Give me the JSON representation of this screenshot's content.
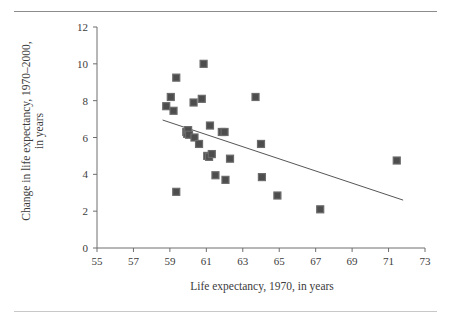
{
  "chart_data": {
    "type": "scatter",
    "title": "",
    "xlabel": "Life expectancy, 1970, in years",
    "ylabel": "Change in life expectancy, 1970–2000,\nin years",
    "xlim": [
      55,
      73
    ],
    "ylim": [
      0,
      12
    ],
    "xticks": [
      55,
      57,
      59,
      61,
      63,
      65,
      67,
      69,
      71,
      73
    ],
    "yticks": [
      0,
      2,
      4,
      6,
      8,
      10,
      12
    ],
    "grid": false,
    "legend": null,
    "marker": {
      "shape": "square",
      "color": "#4d4d4d",
      "size": 7
    },
    "points": [
      {
        "x": 58.8,
        "y": 7.7
      },
      {
        "x": 59.05,
        "y": 8.2
      },
      {
        "x": 59.2,
        "y": 7.45
      },
      {
        "x": 59.35,
        "y": 9.25
      },
      {
        "x": 59.35,
        "y": 3.05
      },
      {
        "x": 59.9,
        "y": 6.3
      },
      {
        "x": 59.95,
        "y": 6.2
      },
      {
        "x": 60.0,
        "y": 6.4
      },
      {
        "x": 60.05,
        "y": 6.15
      },
      {
        "x": 60.3,
        "y": 7.9
      },
      {
        "x": 60.35,
        "y": 6.0
      },
      {
        "x": 60.6,
        "y": 5.65
      },
      {
        "x": 60.75,
        "y": 8.1
      },
      {
        "x": 60.85,
        "y": 10.0
      },
      {
        "x": 61.05,
        "y": 5.0
      },
      {
        "x": 61.15,
        "y": 4.95
      },
      {
        "x": 61.2,
        "y": 6.65
      },
      {
        "x": 61.3,
        "y": 5.1
      },
      {
        "x": 61.5,
        "y": 3.95
      },
      {
        "x": 61.85,
        "y": 6.3
      },
      {
        "x": 62.0,
        "y": 6.3
      },
      {
        "x": 62.05,
        "y": 3.7
      },
      {
        "x": 62.3,
        "y": 4.85
      },
      {
        "x": 63.7,
        "y": 8.2
      },
      {
        "x": 64.0,
        "y": 5.65
      },
      {
        "x": 64.05,
        "y": 3.85
      },
      {
        "x": 64.9,
        "y": 2.85
      },
      {
        "x": 67.25,
        "y": 2.1
      },
      {
        "x": 71.45,
        "y": 4.75
      }
    ],
    "trendline": {
      "type": "linear",
      "x0": 58.6,
      "y0": 6.95,
      "x1": 71.8,
      "y1": 2.6,
      "color": "#555555"
    }
  },
  "axes": {
    "x_tick_labels": [
      "55",
      "57",
      "59",
      "61",
      "63",
      "65",
      "67",
      "69",
      "71",
      "73"
    ],
    "y_tick_labels": [
      "0",
      "2",
      "4",
      "6",
      "8",
      "10",
      "12"
    ],
    "x_axis_title": "Life expectancy, 1970, in years",
    "y_axis_title_line1": "Change in life expectancy, 1970–2000,",
    "y_axis_title_line2": "in years"
  },
  "colors": {
    "marker": "#4d4d4d",
    "trendline": "#555555",
    "axis": "#6e6e6e",
    "rule_top": "#8c8c8c",
    "rule_bottom": "#c8c8c8",
    "text": "#3c3c3c",
    "background": "#ffffff"
  }
}
